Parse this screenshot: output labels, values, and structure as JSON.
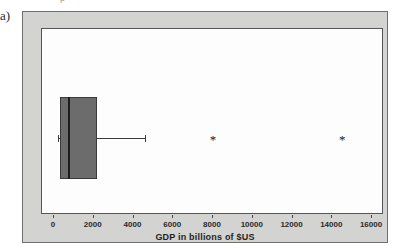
{
  "figure": {
    "part_label": "a)",
    "cropped_top_text": "p"
  },
  "chart_data": {
    "type": "boxplot",
    "title": "",
    "orientation": "horizontal",
    "xlabel": "GDP in billions of $US",
    "ylabel": "",
    "xlim": [
      -400,
      16800
    ],
    "xticks": [
      0,
      2000,
      4000,
      6000,
      8000,
      10000,
      12000,
      14000,
      16000
    ],
    "xticklabels": [
      "0",
      "2000",
      "4000",
      "6000",
      "8000",
      "10000",
      "12000",
      "14000",
      "16000"
    ],
    "grid": false,
    "legend": false,
    "series": [
      {
        "name": "GDP",
        "q1": 300,
        "median": 700,
        "q3": 2160,
        "whisker_low": 200,
        "whisker_high": 4570,
        "outliers": [
          8000,
          14500
        ]
      }
    ],
    "colors": {
      "box_fill": "#6c6c6c",
      "box_edge": "#3a3a3a",
      "median": "#1d1d1d",
      "whisker": "#3c3c3c",
      "outlier": "#171717",
      "panel_background": "#d3d3d1",
      "plot_background": "#fdfdfd",
      "axis_text": "#2a2a2a"
    },
    "outlier_marker": "*"
  }
}
